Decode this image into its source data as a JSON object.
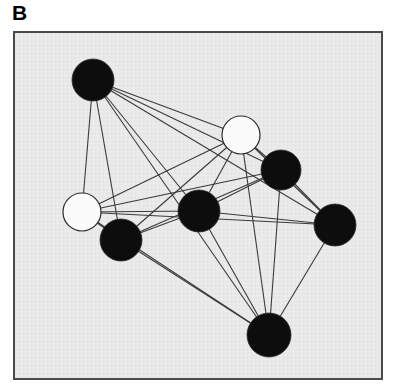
{
  "figure": {
    "panel_label": "B",
    "caption": "",
    "type": "network-graph"
  },
  "panel": {
    "background_color": "#e9e9e9",
    "border_color": "#4a4a4a",
    "border_width": 2,
    "x": 13,
    "y": 31,
    "width": 370,
    "height": 349
  },
  "graph_data": {
    "type": "network",
    "node_fill_black": "#0d0d0d",
    "node_fill_white": "#fbfbfb",
    "node_stroke": "#2b2b2b",
    "edge_color": "#3a3a3a",
    "edge_width": 1.1,
    "node_count": 8,
    "edge_count": 27,
    "nodes": [
      {
        "id": "n1",
        "label": "",
        "state": "black",
        "cx": 80,
        "cy": 49,
        "r": 21
      },
      {
        "id": "n2",
        "label": "",
        "state": "white",
        "cx": 228,
        "cy": 104,
        "r": 19
      },
      {
        "id": "n3",
        "label": "",
        "state": "black",
        "cx": 268,
        "cy": 139,
        "r": 20
      },
      {
        "id": "n4",
        "label": "",
        "state": "white",
        "cx": 69,
        "cy": 181,
        "r": 19
      },
      {
        "id": "n5",
        "label": "",
        "state": "black",
        "cx": 186,
        "cy": 180,
        "r": 21
      },
      {
        "id": "n6",
        "label": "",
        "state": "black",
        "cx": 322,
        "cy": 194,
        "r": 21
      },
      {
        "id": "n7",
        "label": "",
        "state": "black",
        "cx": 108,
        "cy": 209,
        "r": 21
      },
      {
        "id": "n8",
        "label": "",
        "state": "black",
        "cx": 256,
        "cy": 304,
        "r": 22
      }
    ],
    "edges": [
      {
        "source": "n1",
        "target": "n2"
      },
      {
        "source": "n1",
        "target": "n3"
      },
      {
        "source": "n1",
        "target": "n4"
      },
      {
        "source": "n1",
        "target": "n5"
      },
      {
        "source": "n1",
        "target": "n6"
      },
      {
        "source": "n1",
        "target": "n7"
      },
      {
        "source": "n1",
        "target": "n8"
      },
      {
        "source": "n2",
        "target": "n3"
      },
      {
        "source": "n2",
        "target": "n4"
      },
      {
        "source": "n2",
        "target": "n5"
      },
      {
        "source": "n2",
        "target": "n6"
      },
      {
        "source": "n2",
        "target": "n7"
      },
      {
        "source": "n2",
        "target": "n8"
      },
      {
        "source": "n3",
        "target": "n4"
      },
      {
        "source": "n3",
        "target": "n5"
      },
      {
        "source": "n3",
        "target": "n6"
      },
      {
        "source": "n3",
        "target": "n7"
      },
      {
        "source": "n3",
        "target": "n8"
      },
      {
        "source": "n4",
        "target": "n5"
      },
      {
        "source": "n4",
        "target": "n6"
      },
      {
        "source": "n4",
        "target": "n7"
      },
      {
        "source": "n5",
        "target": "n6"
      },
      {
        "source": "n5",
        "target": "n7"
      },
      {
        "source": "n5",
        "target": "n8"
      },
      {
        "source": "n6",
        "target": "n8"
      },
      {
        "source": "n7",
        "target": "n8"
      },
      {
        "source": "n4",
        "target": "n8"
      }
    ],
    "legend": {
      "visible": false,
      "entries": [
        {
          "state": "black",
          "label": ""
        },
        {
          "state": "white",
          "label": ""
        }
      ]
    }
  }
}
